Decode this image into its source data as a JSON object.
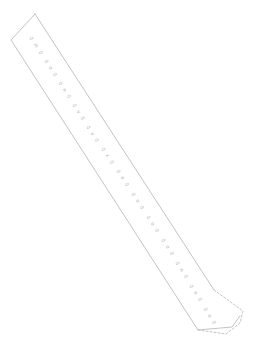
{
  "document": {
    "title": "Printable Strip Template",
    "kind": "paper-strip-worksheet",
    "orientation_degrees": 57,
    "background_color": "#ffffff",
    "outline_color": "#b4b4b8",
    "text_color": "#9a9a9e",
    "outline_width_px": 0.8
  },
  "strip": {
    "name": "diagonal-paper-strip",
    "has_pointed_top": true,
    "has_dashed_tab": true,
    "solid_outline_points": "35,14 11,40 198,330 232,327 240,316",
    "left_edge_points": "11,40 198,330",
    "right_edge_points": "35,14 214,290",
    "dashed_tab_points": "214,290 243,311 240,323 226,334 198,330",
    "dashed_pattern": "2,2"
  },
  "labels": [
    {
      "id": "label-01",
      "text": "0 m 0",
      "x": 31,
      "y": 37,
      "rotate": 57
    },
    {
      "id": "label-02",
      "text": "0 o 0",
      "x": 46,
      "y": 60,
      "rotate": 57
    },
    {
      "id": "label-03",
      "text": "0 n 0",
      "x": 60,
      "y": 82,
      "rotate": 57
    },
    {
      "id": "label-04",
      "text": "0 v 0",
      "x": 74,
      "y": 104,
      "rotate": 57
    },
    {
      "id": "label-05",
      "text": "0 v 0",
      "x": 88,
      "y": 126,
      "rotate": 57
    },
    {
      "id": "label-06",
      "text": "0 x 0",
      "x": 103,
      "y": 148,
      "rotate": 57
    },
    {
      "id": "label-07",
      "text": "0 e 0",
      "x": 118,
      "y": 170,
      "rotate": 57
    },
    {
      "id": "label-08",
      "text": "0 o 0",
      "x": 133,
      "y": 193,
      "rotate": 57
    },
    {
      "id": "label-09",
      "text": "0 o 0",
      "x": 148,
      "y": 216,
      "rotate": 57
    },
    {
      "id": "label-10",
      "text": "0 o 0",
      "x": 163,
      "y": 239,
      "rotate": 57
    },
    {
      "id": "label-11",
      "text": "0 n 0",
      "x": 177,
      "y": 262,
      "rotate": 57
    },
    {
      "id": "label-12",
      "text": "0 n 0",
      "x": 191,
      "y": 285,
      "rotate": 57
    },
    {
      "id": "label-13",
      "text": "0 o 0",
      "x": 205,
      "y": 308,
      "rotate": 57
    }
  ]
}
